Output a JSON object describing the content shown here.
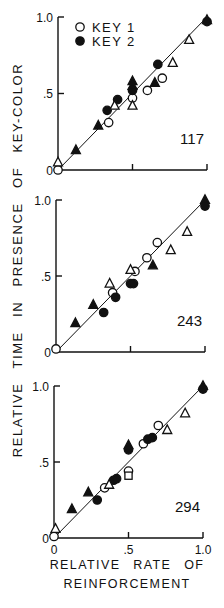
{
  "figure": {
    "y_axis_title": "RELATIVE TIME IN PRESENCE OF KEY-COLOR",
    "x_axis_title_line1": "RELATIVE RATE OF",
    "x_axis_title_line2": "REINFORCEMENT",
    "legend": [
      {
        "label": "KEY 1",
        "marker": "open-circle"
      },
      {
        "label": "KEY 2",
        "marker": "filled-circle"
      }
    ]
  },
  "chart_data": [
    {
      "type": "scatter",
      "title": "117",
      "xlabel": "RELATIVE RATE OF REINFORCEMENT",
      "ylabel": "RELATIVE TIME IN PRESENCE OF KEY-COLOR",
      "xlim": [
        0,
        1.0
      ],
      "ylim": [
        0,
        1.0
      ],
      "x_ticks": [
        "0",
        ".5",
        "1.0"
      ],
      "y_ticks": [
        "0",
        ".5",
        "1.0"
      ],
      "show_x_tick_labels": false,
      "legend": [
        "KEY 1",
        "KEY 2"
      ],
      "reference_line": {
        "from": [
          0,
          0
        ],
        "to": [
          1,
          1
        ]
      },
      "grid": false,
      "series": [
        {
          "name": "KEY 1",
          "marker": "open-circle",
          "points": [
            [
              0,
              0.0
            ],
            [
              0.34,
              0.31
            ],
            [
              0.5,
              0.47
            ],
            [
              0.6,
              0.52
            ],
            [
              0.7,
              0.6
            ]
          ]
        },
        {
          "name": "KEY 2",
          "marker": "filled-circle",
          "points": [
            [
              0.33,
              0.39
            ],
            [
              0.4,
              0.46
            ],
            [
              0.5,
              0.52
            ],
            [
              0.67,
              0.69
            ],
            [
              1.0,
              0.97
            ]
          ]
        },
        {
          "name": "KEY 1 (triangle)",
          "marker": "open-triangle",
          "points": [
            [
              0,
              0.05
            ],
            [
              0.38,
              0.42
            ],
            [
              0.5,
              0.42
            ],
            [
              0.77,
              0.7
            ],
            [
              0.88,
              0.85
            ]
          ]
        },
        {
          "name": "KEY 2 (triangle)",
          "marker": "filled-triangle",
          "points": [
            [
              0.12,
              0.13
            ],
            [
              0.27,
              0.29
            ],
            [
              0.5,
              0.55
            ],
            [
              0.5,
              0.58
            ],
            [
              0.65,
              0.57
            ],
            [
              1.0,
              0.98
            ]
          ]
        }
      ],
      "panel_box": {
        "x0": 58,
        "x1": 207,
        "y0": 170,
        "y1": 17
      }
    },
    {
      "type": "scatter",
      "title": "243",
      "xlabel": "RELATIVE RATE OF REINFORCEMENT",
      "ylabel": "RELATIVE TIME IN PRESENCE OF KEY-COLOR",
      "xlim": [
        0,
        1.0
      ],
      "ylim": [
        0,
        1.0
      ],
      "x_ticks": [
        "0",
        ".5",
        "1.0"
      ],
      "y_ticks": [
        "0",
        ".5",
        "1.0"
      ],
      "show_x_tick_labels": false,
      "reference_line": {
        "from": [
          0,
          0
        ],
        "to": [
          1,
          1
        ]
      },
      "grid": false,
      "series": [
        {
          "name": "KEY 1",
          "marker": "open-circle",
          "points": [
            [
              0,
              0.02
            ],
            [
              0.38,
              0.39
            ],
            [
              0.53,
              0.53
            ],
            [
              0.61,
              0.62
            ],
            [
              0.68,
              0.72
            ]
          ]
        },
        {
          "name": "KEY 2",
          "marker": "filled-circle",
          "points": [
            [
              0.32,
              0.26
            ],
            [
              0.4,
              0.36
            ],
            [
              0.5,
              0.45
            ],
            [
              0.52,
              0.45
            ],
            [
              1.0,
              0.96
            ]
          ]
        },
        {
          "name": "KEY 1 (triangle)",
          "marker": "open-triangle",
          "points": [
            [
              0.36,
              0.45
            ],
            [
              0.5,
              0.54
            ],
            [
              0.77,
              0.67
            ],
            [
              0.88,
              0.79
            ]
          ]
        },
        {
          "name": "KEY 2 (triangle)",
          "marker": "filled-triangle",
          "points": [
            [
              0.13,
              0.19
            ],
            [
              0.25,
              0.31
            ],
            [
              0.65,
              0.57
            ],
            [
              1.0,
              1.0
            ]
          ]
        }
      ],
      "panel_box": {
        "x0": 56,
        "x1": 205,
        "y0": 352,
        "y1": 200
      }
    },
    {
      "type": "scatter",
      "title": "294",
      "xlabel": "RELATIVE RATE OF REINFORCEMENT",
      "ylabel": "RELATIVE TIME IN PRESENCE OF KEY-COLOR",
      "xlim": [
        0,
        1.0
      ],
      "ylim": [
        0,
        1.0
      ],
      "x_ticks": [
        "0",
        ".5",
        "1.0"
      ],
      "y_ticks": [
        "0",
        ".5",
        "1.0"
      ],
      "show_x_tick_labels": true,
      "reference_line": {
        "from": [
          0,
          0
        ],
        "to": [
          1,
          1
        ]
      },
      "grid": false,
      "series": [
        {
          "name": "KEY 1",
          "marker": "open-circle",
          "points": [
            [
              0,
              0.01
            ],
            [
              0.34,
              0.33
            ],
            [
              0.5,
              0.44
            ],
            [
              0.6,
              0.62
            ],
            [
              0.7,
              0.74
            ]
          ]
        },
        {
          "name": "KEY 2",
          "marker": "filled-circle",
          "points": [
            [
              0.29,
              0.25
            ],
            [
              0.4,
              0.38
            ],
            [
              0.42,
              0.39
            ],
            [
              0.5,
              0.58
            ],
            [
              0.63,
              0.65
            ],
            [
              0.66,
              0.66
            ],
            [
              1.0,
              0.98
            ]
          ]
        },
        {
          "name": "KEY 1 (triangle)",
          "marker": "open-triangle",
          "points": [
            [
              0.01,
              0.06
            ],
            [
              0.37,
              0.35
            ],
            [
              0.76,
              0.71
            ],
            [
              0.88,
              0.82
            ]
          ]
        },
        {
          "name": "KEY 2 (triangle)",
          "marker": "filled-triangle",
          "points": [
            [
              0.12,
              0.19
            ],
            [
              0.23,
              0.3
            ],
            [
              0.5,
              0.61
            ],
            [
              1.0,
              1.0
            ]
          ]
        },
        {
          "name": "KEY 1 (square)",
          "marker": "open-square",
          "points": [
            [
              0.5,
              0.41
            ]
          ]
        }
      ],
      "panel_box": {
        "x0": 54,
        "x1": 203,
        "y0": 538,
        "y1": 386
      }
    }
  ]
}
